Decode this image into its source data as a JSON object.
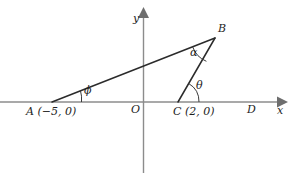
{
  "figure": {
    "kind": "coordinate-geometry-diagram",
    "background_color": "#ffffff",
    "width": 293,
    "height": 173
  },
  "axes": {
    "x_axis_label": "x",
    "y_axis_label": "y",
    "origin_label": "O",
    "x_axis_color": "#8c8c8c",
    "y_axis_color": "#8c8c8c"
  },
  "points": {
    "A": {
      "name": "A",
      "coordinate_text": "(−5, 0)",
      "x": -5,
      "y": 0,
      "px": 52,
      "py": 102
    },
    "B": {
      "name": "B",
      "coordinate_text": "",
      "px": 215,
      "py": 38
    },
    "C": {
      "name": "C",
      "coordinate_text": "(2, 0)",
      "x": 2,
      "y": 0,
      "px": 178,
      "py": 102
    },
    "D": {
      "name": "D",
      "coordinate_text": "",
      "px": 250,
      "py": 102
    },
    "O": {
      "name": "O",
      "coordinate_text": "",
      "x": 0,
      "y": 0,
      "px": 143,
      "py": 102
    }
  },
  "angles": {
    "phi": {
      "symbol": "ϕ",
      "at_vertex": "A",
      "between": "AD and AB"
    },
    "alpha": {
      "symbol": "α",
      "at_vertex": "B",
      "between": "BA and BC"
    },
    "theta": {
      "symbol": "θ",
      "at_vertex": "C",
      "between": "CB and CD"
    }
  },
  "segments": {
    "AB": {
      "from": "A",
      "to": "B",
      "color": "#2b2b2b"
    },
    "BC": {
      "from": "B",
      "to": "C",
      "color": "#2b2b2b"
    }
  },
  "style": {
    "line_color": "#2b2b2b",
    "arc_color": "#3a3a3a",
    "text_color": "#1e1e1e"
  }
}
